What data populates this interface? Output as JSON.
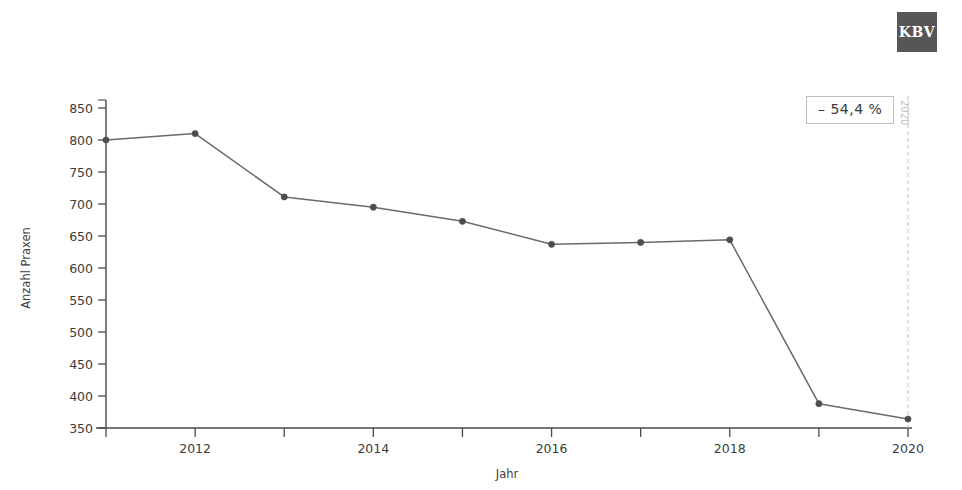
{
  "logo": {
    "text": "KBV",
    "name": "kbv-logo",
    "background": "#565656",
    "color": "#ffffff"
  },
  "annotation": {
    "delta_label": "– 54,4 %",
    "marker_year_label": "2020"
  },
  "chart_data": {
    "type": "line",
    "title": "",
    "subtitle": "",
    "xlabel": "Jahr",
    "ylabel": "Anzahl Praxen",
    "x": [
      2011,
      2012,
      2013,
      2014,
      2015,
      2016,
      2017,
      2018,
      2019,
      2020
    ],
    "values": [
      800,
      810,
      711,
      695,
      673,
      637,
      640,
      644,
      388,
      364
    ],
    "series": [
      {
        "name": "Anzahl Praxen",
        "values": [
          800,
          810,
          711,
          695,
          673,
          637,
          640,
          644,
          388,
          364
        ],
        "color": "#6a6a6a",
        "marker_color": "#4d4d4d"
      }
    ],
    "xlim": [
      2010.7,
      2020.3
    ],
    "ylim": [
      350,
      860
    ],
    "x_tick_values": [
      2011,
      2012,
      2013,
      2014,
      2015,
      2016,
      2017,
      2018,
      2019,
      2020
    ],
    "x_tick_labels": [
      "",
      "2012",
      "",
      "2014",
      "",
      "2016",
      "",
      "2018",
      "",
      "2020"
    ],
    "y_ticks": [
      350,
      400,
      450,
      500,
      550,
      600,
      650,
      700,
      750,
      800,
      850
    ],
    "y_tick_labels": [
      "350",
      "400",
      "450",
      "500",
      "550",
      "600",
      "650",
      "700",
      "750",
      "800",
      "850"
    ],
    "grid": false,
    "legend": false,
    "legend_position": "none",
    "annotations": [
      {
        "text": "– 54,4 %",
        "kind": "badge"
      },
      {
        "text": "2020",
        "kind": "vertical-marker-label"
      }
    ],
    "background": "#ffffff"
  }
}
